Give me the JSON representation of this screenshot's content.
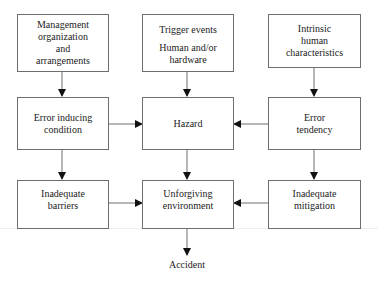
{
  "diagram": {
    "type": "flowchart",
    "nodes": {
      "management": {
        "lines": [
          "Management",
          "organization",
          "and",
          "arrangements"
        ]
      },
      "trigger": {
        "lines": [
          "Trigger events",
          "",
          "Human and/or",
          "hardware"
        ]
      },
      "intrinsic": {
        "lines": [
          "Intrinsic",
          "human",
          "characteristics"
        ]
      },
      "error_inducing": {
        "lines": [
          "Error inducing",
          "condition"
        ]
      },
      "hazard": {
        "lines": [
          "Hazard"
        ]
      },
      "error_tendency": {
        "lines": [
          "Error",
          "tendency"
        ]
      },
      "inadequate_barriers": {
        "lines": [
          "Inadequate",
          "barriers"
        ]
      },
      "unforgiving": {
        "lines": [
          "Unforgiving",
          "environment"
        ]
      },
      "inadequate_mitigation": {
        "lines": [
          "Inadequate",
          "mitigation"
        ]
      },
      "accident": {
        "label": "Accident"
      }
    },
    "edges": [
      {
        "from": "Management organization and arrangements",
        "to": "Error inducing condition"
      },
      {
        "from": "Trigger events / Human and/or hardware",
        "to": "Hazard"
      },
      {
        "from": "Intrinsic human characteristics",
        "to": "Error tendency"
      },
      {
        "from": "Error inducing condition",
        "to": "Hazard"
      },
      {
        "from": "Error tendency",
        "to": "Hazard"
      },
      {
        "from": "Error inducing condition",
        "to": "Inadequate barriers"
      },
      {
        "from": "Hazard",
        "to": "Unforgiving environment"
      },
      {
        "from": "Error tendency",
        "to": "Inadequate mitigation"
      },
      {
        "from": "Inadequate barriers",
        "to": "Unforgiving environment"
      },
      {
        "from": "Inadequate mitigation",
        "to": "Unforgiving environment"
      },
      {
        "from": "Unforgiving environment",
        "to": "Accident"
      }
    ],
    "colors": {
      "line": "#6e6e6e",
      "arrow": "#111111",
      "text": "#222222"
    }
  }
}
